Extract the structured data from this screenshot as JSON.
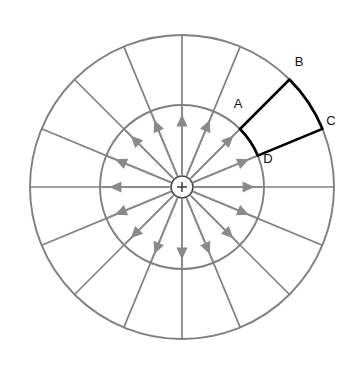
{
  "figure": {
    "background_color": "#ffffff",
    "center": {
      "x": 182,
      "y": 187
    },
    "charge": {
      "symbol": "+",
      "polarity": "positive",
      "marker_radius": 11,
      "outline_color": "#4a4a4a",
      "fill_color": "#ffffff"
    },
    "circles": [
      {
        "name": "inner-circle",
        "radius": 82,
        "color": "#808080"
      },
      {
        "name": "outer-circle",
        "radius": 152,
        "color": "#808080"
      }
    ],
    "spokes": {
      "count": 16,
      "angle_step_degrees": 22.5,
      "color": "#808080"
    },
    "field_arrows": {
      "count": 16,
      "direction": "outward",
      "color": "#8a8a8a",
      "start_radius": 13,
      "end_radius": 80
    },
    "highlight": {
      "color": "#000000",
      "stroke_width": 2.6,
      "start_angle_degrees": 22.5,
      "end_angle_degrees": 45,
      "inner_radius": 82,
      "outer_radius": 152,
      "corners": [
        {
          "id": "A",
          "label": "A",
          "role": "inner-outer-ccw-corner",
          "label_x": 238,
          "label_y": 105
        },
        {
          "id": "B",
          "label": "B",
          "role": "outer-ccw-corner",
          "label_x": 299,
          "label_y": 63
        },
        {
          "id": "C",
          "label": "C",
          "role": "outer-cw-corner",
          "label_x": 331,
          "label_y": 122
        },
        {
          "id": "D",
          "label": "D",
          "role": "inner-cw-corner",
          "label_x": 268,
          "label_y": 160
        }
      ]
    }
  }
}
